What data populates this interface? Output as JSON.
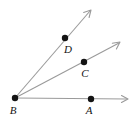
{
  "figure": {
    "background_color": "#ffffff",
    "ray_color": "#9a9a9a",
    "point_color": "#141414",
    "width": 135,
    "height": 123
  },
  "points": [
    {
      "label": "A",
      "x": 91,
      "y": 99,
      "label_x": 89,
      "label_y": 114,
      "on_ray": "BA"
    },
    {
      "label": "B",
      "x": 15,
      "y": 98,
      "label_x": 13,
      "label_y": 114,
      "on_ray": "vertex"
    },
    {
      "label": "C",
      "x": 84,
      "y": 62,
      "label_x": 85,
      "label_y": 77,
      "on_ray": "BC"
    },
    {
      "label": "D",
      "x": 65,
      "y": 38,
      "label_x": 68,
      "label_y": 53,
      "on_ray": "BD"
    }
  ],
  "rays": [
    {
      "name": "BA",
      "from_label": "B",
      "through_label": "A",
      "start_x": 15,
      "start_y": 98,
      "end_x": 128,
      "end_y": 99,
      "arrow": "true"
    },
    {
      "name": "BC",
      "from_label": "B",
      "through_label": "C",
      "start_x": 15,
      "start_y": 98,
      "end_x": 120,
      "end_y": 42,
      "arrow": "true"
    },
    {
      "name": "BD",
      "from_label": "B",
      "through_label": "D",
      "start_x": 15,
      "start_y": 98,
      "end_x": 91,
      "end_y": 10,
      "arrow": "true"
    }
  ],
  "labels": {
    "a": "A",
    "b": "B",
    "c": "C",
    "d": "D"
  }
}
